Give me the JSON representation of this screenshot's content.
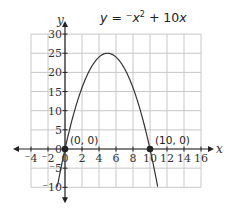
{
  "chart_data": {
    "type": "line",
    "title_parts": {
      "prefix": "y = ",
      "neg": "⁻",
      "x": "x",
      "sup": "2",
      "suffix": " + 10x"
    },
    "xlabel": "x",
    "ylabel": "y",
    "xlim": [
      -4,
      16
    ],
    "ylim": [
      -10,
      30
    ],
    "grid": true,
    "x_ticks": [
      -4,
      -2,
      0,
      2,
      4,
      6,
      8,
      10,
      12,
      14,
      16
    ],
    "x_tick_labels": [
      "⁻4",
      "⁻2",
      "0",
      "2",
      "4",
      "6",
      "8",
      "10",
      "12",
      "14",
      "16"
    ],
    "y_ticks": [
      -10,
      -5,
      0,
      5,
      10,
      15,
      20,
      25,
      30
    ],
    "y_tick_labels": [
      "⁻10",
      "⁻5",
      "0",
      "5",
      "10",
      "15",
      "20",
      "25",
      "30"
    ],
    "series": [
      {
        "name": "y = -x^2 + 10x",
        "equation": "y = -x^2 + 10x",
        "x": [
          -0.9,
          0,
          1,
          2,
          3,
          4,
          5,
          6,
          7,
          8,
          9,
          10,
          10.9
        ],
        "y": [
          -9.81,
          0,
          9,
          16,
          21,
          24,
          25,
          24,
          21,
          16,
          9,
          0,
          -9.81
        ]
      }
    ],
    "points": [
      {
        "x": 0,
        "y": 0,
        "label": "(0, 0)"
      },
      {
        "x": 10,
        "y": 0,
        "label": "(10, 0)"
      }
    ],
    "annotations": [
      "(0, 0)",
      "(10, 0)"
    ]
  }
}
